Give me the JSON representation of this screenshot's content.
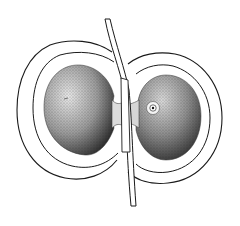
{
  "figure": {
    "colors": {
      "background": "#ffffff",
      "ink": "#1a1a1a",
      "stipple_dark": "#2a2a2a",
      "stipple_light": "#bdbdbd"
    }
  }
}
